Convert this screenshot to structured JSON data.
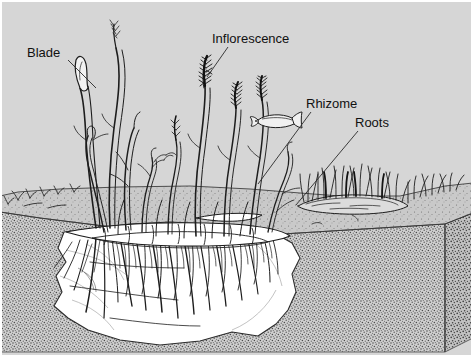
{
  "figure": {
    "style": "black-and-white pen-and-ink scientific illustration",
    "width": 473,
    "height": 357,
    "background_color": "#d6d6d6",
    "border_color": "#8c8c8c",
    "ink_color": "#1a1a1a",
    "cutaway_color": "#ffffff",
    "sediment_color": "#cfcfcf",
    "water_color": "#d6d6d6",
    "seafloor_color": "#c9c9c9"
  },
  "labels": [
    {
      "id": "blade",
      "text": "Blade",
      "x": 27,
      "y": 46,
      "leader_from": [
        68,
        60
      ],
      "leader_to": [
        96,
        88
      ],
      "points_at": "leaf blade of eelgrass shoot"
    },
    {
      "id": "inflorescence",
      "text": "Inflorescence",
      "x": 212,
      "y": 32,
      "leader_from": [
        228,
        47
      ],
      "leader_to": [
        207,
        77
      ],
      "points_at": "flowering spike at top of reproductive shoot"
    },
    {
      "id": "rhizome",
      "text": "Rhizome",
      "x": 306,
      "y": 97,
      "leader_from": [
        311,
        112
      ],
      "leader_to": [
        258,
        184
      ],
      "points_at": "horizontal creeping stem in sediment"
    },
    {
      "id": "roots",
      "text": "Roots",
      "x": 355,
      "y": 116,
      "leader_from": [
        358,
        131
      ],
      "leader_to": [
        296,
        205
      ],
      "points_at": "root mass below rhizome"
    }
  ],
  "scene_elements": [
    {
      "id": "water-column",
      "name": "water column",
      "description": "light gray water above the seafloor"
    },
    {
      "id": "sediment-block",
      "name": "sediment block",
      "description": "stippled three-dimensional block of seafloor sediment cut away at the front"
    },
    {
      "id": "cutaway",
      "name": "root cutaway",
      "description": "white cut face revealing the buried root and rhizome system"
    },
    {
      "id": "eelgrass-clump",
      "name": "eelgrass clump",
      "description": "main clump of tall ribbon-shaped eelgrass blades rising from the rhizome mat"
    },
    {
      "id": "inflorescence-spikes",
      "name": "inflorescence spikes",
      "description": "dark bristly flowering spikes on several shoots"
    },
    {
      "id": "rhizome-mat",
      "name": "rhizome mat",
      "description": "horizontal rhizomes running just below the sediment surface"
    },
    {
      "id": "root-mass",
      "name": "root mass",
      "description": "dense fine roots descending into the sediment"
    },
    {
      "id": "fish",
      "name": "fish",
      "description": "small fish swimming in the water column above the bed"
    },
    {
      "id": "distant-bed",
      "name": "distant eelgrass patch",
      "description": "smaller patch of eelgrass in the background to the right"
    },
    {
      "id": "seedlings",
      "name": "seedlings",
      "description": "small sprouts scattered along the seafloor to the left"
    }
  ]
}
